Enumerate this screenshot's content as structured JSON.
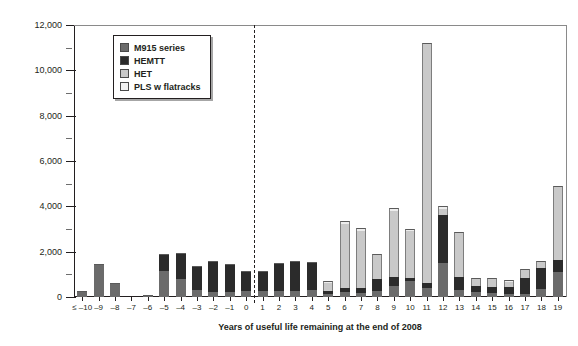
{
  "chart_data": {
    "type": "bar",
    "stacked": true,
    "title": "",
    "xlabel": "Years of useful life remaining at the end of 2008",
    "ylabel": "Number of HTWV",
    "ylim": [
      0,
      12000
    ],
    "ytick_values": [
      0,
      2000,
      4000,
      6000,
      8000,
      10000,
      12000
    ],
    "ytick_labels": [
      "0",
      "2,000",
      "4,000",
      "6,000",
      "8,000",
      "10,000",
      "12,000"
    ],
    "yminor_step": 1000,
    "grid": false,
    "legend_position": "upper-left-inside",
    "annotations": [
      {
        "type": "vertical-dashed-line",
        "between": [
          "0",
          "1"
        ],
        "label": ""
      }
    ],
    "categories": [
      "≤ –10",
      "–9",
      "–8",
      "–7",
      "–6",
      "–5",
      "–4",
      "–3",
      "–2",
      "–1",
      "0",
      "1",
      "2",
      "3",
      "4",
      "5",
      "6",
      "7",
      "8",
      "9",
      "10",
      "11",
      "12",
      "13",
      "14",
      "15",
      "16",
      "17",
      "18",
      "19"
    ],
    "series": [
      {
        "name": "M915 series",
        "color": "#6b6b6b",
        "values": [
          250,
          1450,
          600,
          0,
          70,
          1150,
          800,
          300,
          240,
          240,
          260,
          260,
          280,
          250,
          300,
          150,
          200,
          180,
          250,
          500,
          700,
          400,
          1500,
          300,
          200,
          180,
          150,
          150,
          350,
          1100
        ]
      },
      {
        "name": "HEMTT",
        "color": "#2b2b2b",
        "values": [
          0,
          0,
          0,
          0,
          0,
          750,
          1150,
          1050,
          1350,
          1200,
          900,
          900,
          1200,
          1350,
          1250,
          120,
          200,
          200,
          550,
          400,
          150,
          200,
          2100,
          600,
          300,
          280,
          280,
          700,
          950,
          550
        ]
      },
      {
        "name": "HET",
        "color": "#c9c9c9",
        "values": [
          0,
          0,
          0,
          0,
          0,
          0,
          0,
          0,
          0,
          0,
          0,
          0,
          0,
          0,
          0,
          330,
          2800,
          2550,
          1050,
          2900,
          2050,
          10600,
          300,
          1950,
          300,
          350,
          250,
          350,
          250,
          3200
        ]
      },
      {
        "name": "PLS w flatracks",
        "color": "#ededed",
        "values": [
          0,
          0,
          0,
          0,
          0,
          0,
          0,
          0,
          0,
          0,
          0,
          0,
          0,
          0,
          0,
          100,
          150,
          120,
          60,
          150,
          100,
          0,
          100,
          0,
          60,
          50,
          50,
          50,
          50,
          50
        ]
      }
    ]
  },
  "legend": {
    "items": [
      {
        "label": "M915 series",
        "key": "m915"
      },
      {
        "label": "HEMTT",
        "key": "hemtt"
      },
      {
        "label": "HET",
        "key": "het"
      },
      {
        "label": "PLS w flatracks",
        "key": "pls"
      }
    ]
  }
}
